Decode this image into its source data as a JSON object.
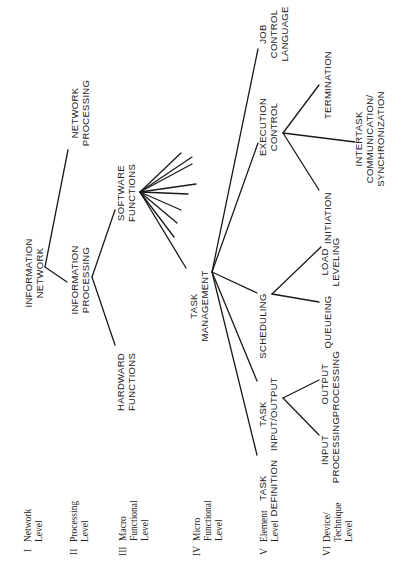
{
  "diagram": {
    "orientation": "rotated-90-ccw",
    "nodes": {
      "information_network": {
        "lines": [
          "INFORMATION",
          "NETWORK"
        ]
      },
      "network_processing": {
        "lines": [
          "NETWORK",
          "PROCESSING"
        ]
      },
      "information_processing": {
        "lines": [
          "INFORMATION",
          "PROCESSING"
        ]
      },
      "software_functions": {
        "lines": [
          "SOFTWARE",
          "FUNCTIONS"
        ]
      },
      "hardward_functions": {
        "lines": [
          "HARDWARD",
          "FUNCTIONS"
        ]
      },
      "task_management": {
        "lines": [
          "TASK",
          "MANAGEMENT"
        ]
      },
      "job_control_language": {
        "lines": [
          "JOB",
          "CONTROL",
          "LANGUAGE"
        ]
      },
      "execution_control": {
        "lines": [
          "EXECUTION",
          "CONTROL"
        ]
      },
      "scheduling": {
        "lines": [
          "SCHEDULING"
        ]
      },
      "task_input_output": {
        "lines": [
          "TASK",
          "INPUT/OUTPUT"
        ]
      },
      "task_definition": {
        "lines": [
          "TASK",
          "DEFINITION"
        ]
      },
      "termination": {
        "lines": [
          "TERMINATION"
        ]
      },
      "intertask": {
        "lines": [
          "INTERTASK",
          "COMMUNICATION/",
          "SYNCHRONIZATION"
        ]
      },
      "initiation": {
        "lines": [
          "INITIATION"
        ]
      },
      "load_leveling": {
        "lines": [
          "LOAD",
          "LEVELING"
        ]
      },
      "queueing": {
        "lines": [
          "QUEUEING"
        ]
      },
      "output_processing": {
        "lines": [
          "OUTPUT",
          "PROCESSING"
        ]
      },
      "input_processing": {
        "lines": [
          "INPUT",
          "PROCESSING"
        ]
      }
    },
    "edges": [
      [
        "information_network",
        "network_processing"
      ],
      [
        "information_network",
        "information_processing"
      ],
      [
        "information_processing",
        "software_functions"
      ],
      [
        "information_processing",
        "hardward_functions"
      ],
      [
        "software_functions",
        "task_management"
      ],
      [
        "task_management",
        "job_control_language"
      ],
      [
        "task_management",
        "execution_control"
      ],
      [
        "task_management",
        "scheduling"
      ],
      [
        "task_management",
        "task_input_output"
      ],
      [
        "task_management",
        "task_definition"
      ],
      [
        "execution_control",
        "termination"
      ],
      [
        "execution_control",
        "intertask"
      ],
      [
        "execution_control",
        "initiation"
      ],
      [
        "scheduling",
        "load_leveling"
      ],
      [
        "scheduling",
        "queueing"
      ],
      [
        "task_input_output",
        "output_processing"
      ],
      [
        "task_input_output",
        "input_processing"
      ]
    ],
    "software_functions_unlabeled_branches": 8,
    "levels": [
      {
        "roman": "I",
        "lines": [
          "Network",
          "Level"
        ]
      },
      {
        "roman": "II",
        "lines": [
          "Processing",
          "Level"
        ]
      },
      {
        "roman": "III",
        "lines": [
          "Macro",
          "Functional",
          "Level"
        ]
      },
      {
        "roman": "IV",
        "lines": [
          "Micro",
          "Functional",
          "Level"
        ]
      },
      {
        "roman": "V",
        "lines": [
          "Element",
          "Level"
        ]
      },
      {
        "roman": "VI",
        "lines": [
          "Device/",
          "Technique",
          "Level"
        ]
      }
    ]
  }
}
